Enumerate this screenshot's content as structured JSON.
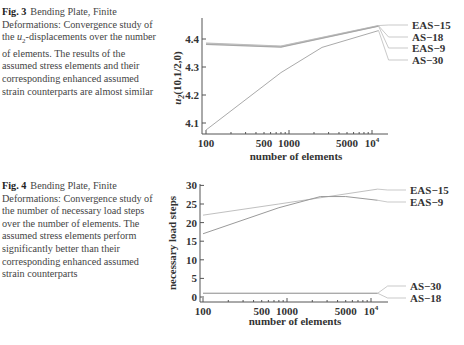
{
  "figures": [
    {
      "label": "Fig. 3",
      "caption_pre": "Bending Plate, Finite Deformations: Convergence study of the ",
      "caption_var": "u",
      "caption_sub": "2",
      "caption_post": "-displacements over the number of elements. The results of the assumed stress elements and their corresponding enhanced assumed strain counterparts are almost similar"
    },
    {
      "label": "Fig. 4",
      "caption": "Bending Plate, Finite Deformations: Convergence study of the number of necessary load steps over the number of elements. The assumed stress elements perform significantly better than their corresponding enhanced assumed strain counterparts"
    }
  ],
  "chart_data": [
    {
      "type": "line",
      "title": "",
      "xlabel": "number of elements",
      "ylabel": "u2(10,1/2,0)",
      "xscale": "log",
      "xticks": [
        "100",
        "500",
        "1000",
        "5000",
        "10^4"
      ],
      "yticks": [
        "4.1",
        "4.2",
        "4.3",
        "4.4"
      ],
      "ylim": [
        4.05,
        4.47
      ],
      "series": [
        {
          "name": "EAS-15",
          "x": [
            100,
            800,
            12000
          ],
          "values": [
            4.385,
            4.375,
            4.448
          ]
        },
        {
          "name": "AS-18",
          "x": [
            100,
            800,
            12000
          ],
          "values": [
            4.383,
            4.373,
            4.447
          ]
        },
        {
          "name": "EAS-9",
          "x": [
            100,
            800,
            12000
          ],
          "values": [
            4.381,
            4.371,
            4.446
          ]
        },
        {
          "name": "AS-30",
          "x": [
            100,
            800,
            2500,
            12000
          ],
          "values": [
            4.075,
            4.28,
            4.37,
            4.43
          ]
        }
      ],
      "legend_position": "right"
    },
    {
      "type": "line",
      "title": "",
      "xlabel": "number of elements",
      "ylabel": "necessary load steps",
      "xscale": "log",
      "xticks": [
        "100",
        "500",
        "1000",
        "5000",
        "10^4"
      ],
      "yticks": [
        "0",
        "5",
        "10",
        "15",
        "20",
        "25",
        "30"
      ],
      "ylim": [
        0,
        30
      ],
      "series": [
        {
          "name": "EAS-15",
          "x": [
            100,
            800,
            12000
          ],
          "values": [
            22,
            25,
            29
          ]
        },
        {
          "name": "EAS-9",
          "x": [
            100,
            800,
            2500,
            5000,
            12000
          ],
          "values": [
            17,
            24,
            27,
            27,
            26
          ]
        },
        {
          "name": "AS-30",
          "x": [
            100,
            12000
          ],
          "values": [
            1,
            1
          ]
        },
        {
          "name": "AS-18",
          "x": [
            100,
            12000
          ],
          "values": [
            1,
            1
          ]
        }
      ],
      "legend_position": "right"
    }
  ]
}
